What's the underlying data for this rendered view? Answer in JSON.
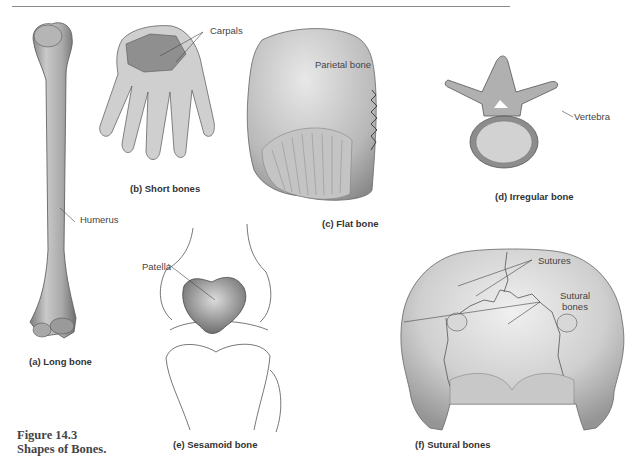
{
  "figure": {
    "number": "Figure 14.3",
    "title": "Shapes of Bones."
  },
  "panels": [
    {
      "id": "a",
      "caption": "(a) Long bone",
      "labels": [
        "Humerus"
      ]
    },
    {
      "id": "b",
      "caption": "(b) Short bones",
      "labels": [
        "Carpals"
      ]
    },
    {
      "id": "c",
      "caption": "(c) Flat bone",
      "labels": [
        "Parietal bone"
      ]
    },
    {
      "id": "d",
      "caption": "(d) Irregular bone",
      "labels": [
        "Vertebra"
      ]
    },
    {
      "id": "e",
      "caption": "(e) Sesamoid bone",
      "labels": [
        "Patella"
      ]
    },
    {
      "id": "f",
      "caption": "(f) Sutural bones",
      "labels": [
        "Sutures",
        "Sutural bones"
      ]
    }
  ],
  "sutural_bones_lines": [
    "Sutural",
    "bones"
  ]
}
